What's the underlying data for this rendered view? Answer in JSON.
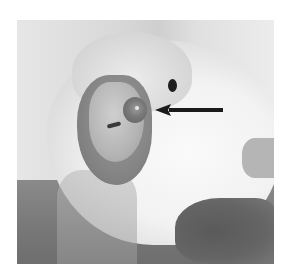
{
  "figure": {
    "type": "grayscale photograph",
    "annotation": {
      "shape": "arrow",
      "direction": "left",
      "points_to": "round lesion beside the beak",
      "color": "#1a1a1a"
    },
    "colors": {
      "page_background": "#ffffff",
      "arrow": "#1a1a1a",
      "eye": "#1e1e1e"
    }
  }
}
